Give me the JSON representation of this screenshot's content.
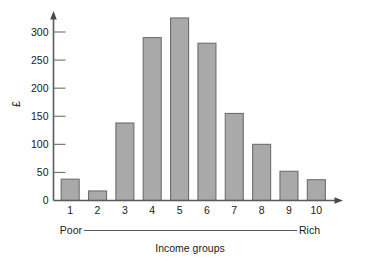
{
  "chart_data": {
    "type": "bar",
    "title": "",
    "subtitle": "",
    "xlabel": "Income groups",
    "ylabel": "£",
    "categories": [
      "1",
      "2",
      "3",
      "4",
      "5",
      "6",
      "7",
      "8",
      "9",
      "10"
    ],
    "values": [
      38,
      17,
      138,
      290,
      325,
      280,
      155,
      100,
      52,
      37
    ],
    "ylim": [
      0,
      340
    ],
    "y_ticks": [
      0,
      50,
      100,
      150,
      200,
      250,
      300
    ],
    "y_tick_labels": [
      "0",
      "50",
      "100",
      "150",
      "200",
      "250",
      "300"
    ],
    "grid": false,
    "legend": null,
    "annotations": {
      "axis_range_left": "Poor",
      "axis_range_right": "Rich"
    },
    "series": [
      {
        "name": "Spending",
        "values": [
          38,
          17,
          138,
          290,
          325,
          280,
          155,
          100,
          52,
          37
        ]
      }
    ],
    "colors": {
      "bar_fill": "#a9a9a9",
      "bar_stroke": "#6e6e6e",
      "axis": "#5a5a5a",
      "text": "#1a1a1a",
      "background": "#ffffff"
    }
  }
}
